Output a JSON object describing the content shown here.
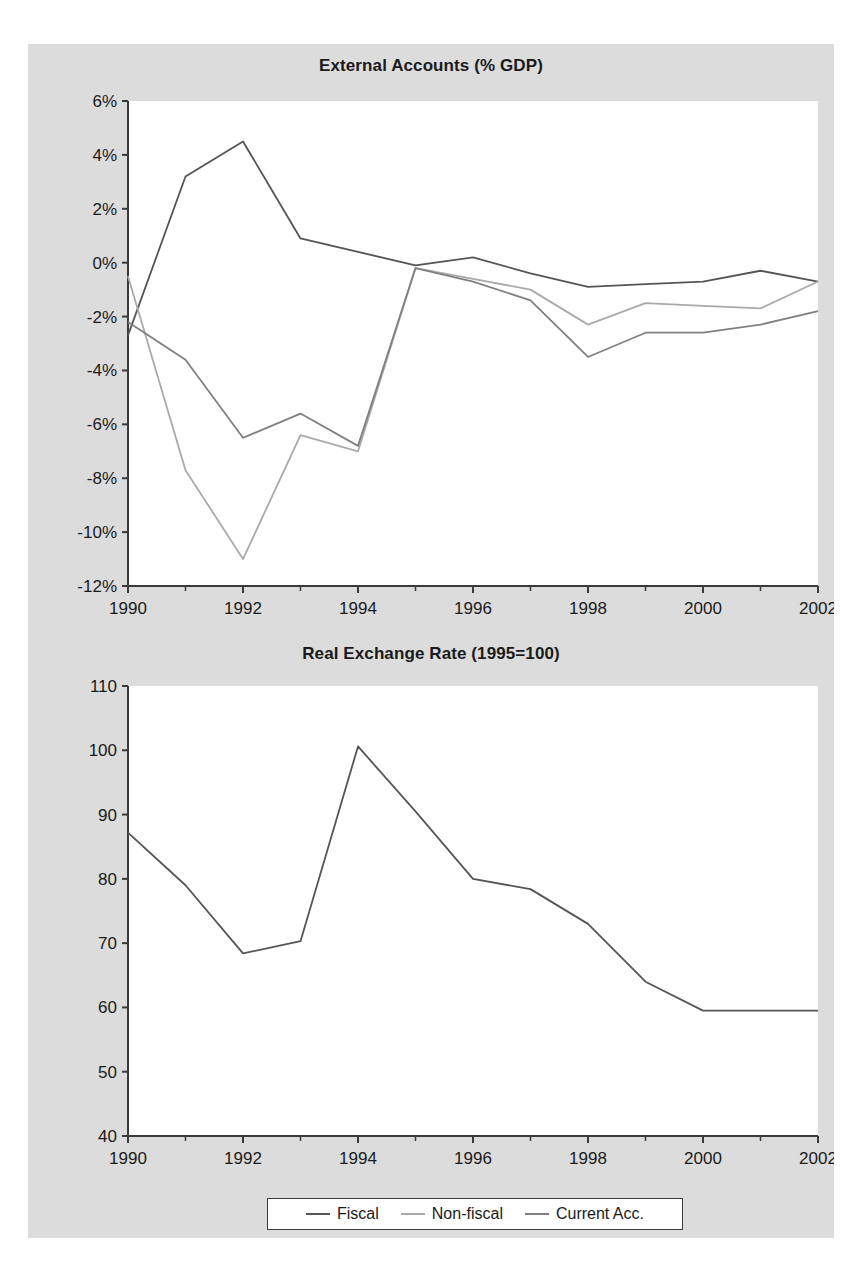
{
  "figure": {
    "background_color": "#dcdcdc",
    "panel_color": "#ffffff",
    "page_color": "#ffffff"
  },
  "legend": {
    "position": "bottom-center",
    "entries": [
      {
        "label": "Fiscal",
        "color": "#555555"
      },
      {
        "label": "Non-fiscal",
        "color": "#aaaaaa"
      },
      {
        "label": "Current Acc.",
        "color": "#808080"
      }
    ]
  },
  "chart_data": [
    {
      "type": "line",
      "title": "External Accounts (% GDP)",
      "xlabel": "",
      "ylabel": "",
      "x": [
        1990,
        1991,
        1992,
        1993,
        1994,
        1995,
        1996,
        1997,
        1998,
        1999,
        2000,
        2001,
        2002
      ],
      "xlim": [
        1990,
        2002
      ],
      "ylim": [
        -12,
        6
      ],
      "xticks": [
        1990,
        1992,
        1994,
        1996,
        1998,
        2000,
        2002
      ],
      "xtick_labels": [
        "1990",
        "1992",
        "1994",
        "1996",
        "1998",
        "2000",
        "2002"
      ],
      "xminor_ticks": [
        1991,
        1993,
        1995,
        1997,
        1999,
        2001
      ],
      "yticks": [
        6,
        4,
        2,
        0,
        -2,
        -4,
        -6,
        -8,
        -10,
        -12
      ],
      "ytick_labels": [
        "6%",
        "4%",
        "2%",
        "0%",
        "-2%",
        "-4%",
        "-6%",
        "-8%",
        "-10%",
        "-12%"
      ],
      "grid": false,
      "series": [
        {
          "name": "Fiscal",
          "color": "#555555",
          "values": [
            -2.7,
            3.2,
            4.5,
            0.9,
            0.4,
            -0.1,
            0.2,
            -0.4,
            -0.9,
            -0.8,
            -0.7,
            -0.3,
            -0.7
          ]
        },
        {
          "name": "Non-fiscal",
          "color": "#aaaaaa",
          "values": [
            -0.5,
            -7.7,
            -11.0,
            -6.4,
            -7.0,
            -0.2,
            -0.6,
            -1.0,
            -2.3,
            -1.5,
            -1.6,
            -1.7,
            -0.7
          ]
        },
        {
          "name": "Current Acc.",
          "color": "#808080",
          "values": [
            -2.2,
            -3.6,
            -6.5,
            -5.6,
            -6.8,
            -0.2,
            -0.7,
            -1.4,
            -3.5,
            -2.6,
            -2.6,
            -2.3,
            -1.8
          ]
        }
      ]
    },
    {
      "type": "line",
      "title": "Real Exchange Rate (1995=100)",
      "xlabel": "",
      "ylabel": "",
      "x": [
        1990,
        1991,
        1992,
        1993,
        1994,
        1995,
        1996,
        1997,
        1998,
        1999,
        2000,
        2001,
        2002
      ],
      "xlim": [
        1990,
        2002
      ],
      "ylim": [
        40,
        110
      ],
      "xticks": [
        1990,
        1992,
        1994,
        1996,
        1998,
        2000,
        2002
      ],
      "xtick_labels": [
        "1990",
        "1992",
        "1994",
        "1996",
        "1998",
        "2000",
        "2002"
      ],
      "xminor_ticks": [
        1991,
        1993,
        1995,
        1997,
        1999,
        2001
      ],
      "yticks": [
        110,
        100,
        90,
        80,
        70,
        60,
        50,
        40
      ],
      "ytick_labels": [
        "110",
        "100",
        "90",
        "80",
        "70",
        "60",
        "50",
        "40"
      ],
      "grid": false,
      "series": [
        {
          "name": "Real Exchange Rate",
          "color": "#555555",
          "values": [
            87.2,
            79.0,
            68.4,
            70.3,
            100.6,
            90.5,
            80.0,
            78.4,
            73.0,
            64.0,
            59.5,
            59.5,
            59.5
          ]
        }
      ],
      "note_series_offset": "first point plotted at 1990; peak at 1995"
    }
  ]
}
